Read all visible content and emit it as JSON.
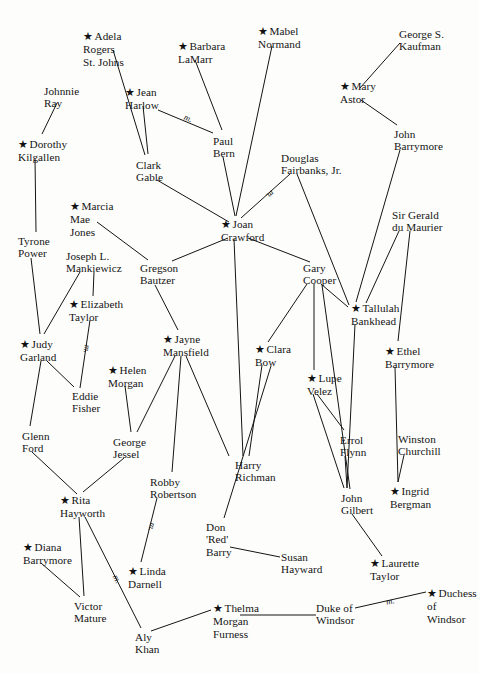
{
  "canvas": {
    "width": 479,
    "height": 674,
    "background": "#fdfdfb",
    "ink": "#141414"
  },
  "legend": {
    "star_glyph": "★",
    "star_meaning": "starred person",
    "marriage_marker": "m.",
    "marriage_meaning": "marriage"
  },
  "nodes": [
    {
      "id": "adela",
      "label": "Adela\nRogers\nSt. Johns",
      "star": true,
      "x": 83,
      "y": 30,
      "align": "left"
    },
    {
      "id": "barbara",
      "label": "Barbara\nLaMarr",
      "star": true,
      "x": 178,
      "y": 40,
      "align": "left"
    },
    {
      "id": "mabel",
      "label": "Mabel\nNormand",
      "star": true,
      "x": 258,
      "y": 25,
      "align": "left"
    },
    {
      "id": "kaufman",
      "label": "George S.\nKaufman",
      "star": false,
      "x": 399,
      "y": 28,
      "align": "left"
    },
    {
      "id": "johnnie",
      "label": "Johnnie\nRay",
      "star": false,
      "x": 44,
      "y": 85,
      "align": "left"
    },
    {
      "id": "harlow",
      "label": "Jean\nHarlow",
      "star": true,
      "x": 125,
      "y": 86,
      "align": "left"
    },
    {
      "id": "maryastor",
      "label": "Mary\nAstor",
      "star": true,
      "x": 340,
      "y": 80,
      "align": "left"
    },
    {
      "id": "dorothy",
      "label": "Dorothy\nKilgallen",
      "star": true,
      "x": 18,
      "y": 138,
      "align": "left"
    },
    {
      "id": "paulbern",
      "label": "Paul\nBern",
      "star": false,
      "x": 213,
      "y": 135,
      "align": "left"
    },
    {
      "id": "jbarry",
      "label": "John\nBarrymore",
      "star": false,
      "x": 394,
      "y": 128,
      "align": "left"
    },
    {
      "id": "gable",
      "label": "Clark\nGable",
      "star": false,
      "x": 136,
      "y": 159,
      "align": "left"
    },
    {
      "id": "fairbanks",
      "label": "Douglas\nFairbanks, Jr.",
      "star": false,
      "x": 281,
      "y": 152,
      "align": "left"
    },
    {
      "id": "marcia",
      "label": "Marcia\nMae\nJones",
      "star": true,
      "x": 70,
      "y": 200,
      "align": "left"
    },
    {
      "id": "joan",
      "label": "Joan\nCrawford",
      "star": true,
      "x": 221,
      "y": 218,
      "align": "left"
    },
    {
      "id": "gerald",
      "label": "Sir Gerald\ndu Maurier",
      "star": false,
      "x": 392,
      "y": 209,
      "align": "left"
    },
    {
      "id": "tyrone",
      "label": "Tyrone\nPower",
      "star": false,
      "x": 18,
      "y": 235,
      "align": "left"
    },
    {
      "id": "joseph",
      "label": "Joseph L.\nMankiewicz",
      "star": false,
      "x": 66,
      "y": 250,
      "align": "left"
    },
    {
      "id": "gregson",
      "label": "Gregson\nBautzer",
      "star": false,
      "x": 140,
      "y": 262,
      "align": "left"
    },
    {
      "id": "gary",
      "label": "Gary\nCooper",
      "star": false,
      "x": 303,
      "y": 262,
      "align": "left"
    },
    {
      "id": "elizabeth",
      "label": "Elizabeth\nTaylor",
      "star": true,
      "x": 69,
      "y": 298,
      "align": "left"
    },
    {
      "id": "tallulah",
      "label": "Tallulah\nBankhead",
      "star": true,
      "x": 351,
      "y": 302,
      "align": "left"
    },
    {
      "id": "jayne",
      "label": "Jayne\nMansfield",
      "star": true,
      "x": 163,
      "y": 333,
      "align": "left"
    },
    {
      "id": "judy",
      "label": "Judy\nGarland",
      "star": true,
      "x": 20,
      "y": 338,
      "align": "left"
    },
    {
      "id": "clara",
      "label": "Clara\nBow",
      "star": true,
      "x": 255,
      "y": 343,
      "align": "left"
    },
    {
      "id": "ethel",
      "label": "Ethel\nBarrymore",
      "star": true,
      "x": 385,
      "y": 345,
      "align": "left"
    },
    {
      "id": "helen",
      "label": "Helen\nMorgan",
      "star": true,
      "x": 108,
      "y": 364,
      "align": "left"
    },
    {
      "id": "lupe",
      "label": "Lupe\nVelez",
      "star": true,
      "x": 307,
      "y": 372,
      "align": "left"
    },
    {
      "id": "eddie",
      "label": "Eddie\nFisher",
      "star": false,
      "x": 72,
      "y": 390,
      "align": "left"
    },
    {
      "id": "glenn",
      "label": "Glenn\nFord",
      "star": false,
      "x": 22,
      "y": 430,
      "align": "left"
    },
    {
      "id": "jessel",
      "label": "George\nJessel",
      "star": false,
      "x": 113,
      "y": 436,
      "align": "left"
    },
    {
      "id": "errol",
      "label": "Errol\nFlynn",
      "star": false,
      "x": 340,
      "y": 434,
      "align": "left"
    },
    {
      "id": "winston",
      "label": "Winston\nChurchill",
      "star": false,
      "x": 398,
      "y": 433,
      "align": "left"
    },
    {
      "id": "robby",
      "label": "Robby\nRobertson",
      "star": false,
      "x": 150,
      "y": 476,
      "align": "left"
    },
    {
      "id": "harryr",
      "label": "Harry\nRichman",
      "star": false,
      "x": 235,
      "y": 459,
      "align": "left"
    },
    {
      "id": "rita",
      "label": "Rita\nHayworth",
      "star": true,
      "x": 60,
      "y": 494,
      "align": "left"
    },
    {
      "id": "gilbert",
      "label": "John\nGilbert",
      "star": false,
      "x": 341,
      "y": 492,
      "align": "left"
    },
    {
      "id": "ingrid",
      "label": "Ingrid\nBergman",
      "star": true,
      "x": 390,
      "y": 485,
      "align": "left"
    },
    {
      "id": "donred",
      "label": "Don\n'Red'\nBarry",
      "star": false,
      "x": 206,
      "y": 521,
      "align": "left"
    },
    {
      "id": "diana",
      "label": "Diana\nBarrymore",
      "star": true,
      "x": 23,
      "y": 541,
      "align": "left"
    },
    {
      "id": "susan",
      "label": "Susan\nHayward",
      "star": false,
      "x": 281,
      "y": 551,
      "align": "left"
    },
    {
      "id": "laurette",
      "label": "Laurette\nTaylor",
      "star": true,
      "x": 370,
      "y": 557,
      "align": "left"
    },
    {
      "id": "linda",
      "label": "Linda\nDarnell",
      "star": true,
      "x": 128,
      "y": 565,
      "align": "left"
    },
    {
      "id": "duchess",
      "label": "Duchess of\nWindsor",
      "star": true,
      "x": 427,
      "y": 587,
      "align": "left"
    },
    {
      "id": "victor",
      "label": "Victor\nMature",
      "x": 74,
      "y": 600,
      "star": false,
      "align": "left"
    },
    {
      "id": "thelma",
      "label": "Thelma\nMorgan\nFurness",
      "star": true,
      "x": 213,
      "y": 602,
      "align": "left"
    },
    {
      "id": "dukew",
      "label": "Duke of\nWindsor",
      "star": false,
      "x": 316,
      "y": 602,
      "align": "left"
    },
    {
      "id": "aly",
      "label": "Aly\nKhan",
      "star": false,
      "x": 135,
      "y": 631,
      "align": "left"
    }
  ],
  "edges": [
    {
      "from": "adela",
      "to": "gable",
      "x1": 113,
      "y1": 50,
      "x2": 145,
      "y2": 155,
      "marriage": false
    },
    {
      "from": "barbara",
      "to": "paulbern",
      "x1": 195,
      "y1": 60,
      "x2": 222,
      "y2": 130,
      "marriage": false
    },
    {
      "from": "mabel",
      "to": "joan",
      "x1": 272,
      "y1": 46,
      "x2": 236,
      "y2": 216,
      "marriage": false
    },
    {
      "from": "kaufman",
      "to": "maryastor",
      "x1": 400,
      "y1": 43,
      "x2": 360,
      "y2": 88,
      "marriage": false
    },
    {
      "from": "johnnie",
      "to": "dorothy",
      "x1": 57,
      "y1": 103,
      "x2": 42,
      "y2": 134,
      "marriage": false
    },
    {
      "from": "harlow",
      "to": "gable",
      "x1": 143,
      "y1": 106,
      "x2": 148,
      "y2": 154,
      "marriage": false
    },
    {
      "from": "harlow",
      "to": "paulbern",
      "x1": 158,
      "y1": 110,
      "x2": 213,
      "y2": 133,
      "marriage": true,
      "mx": 184,
      "my": 113
    },
    {
      "from": "maryastor",
      "to": "jbarry",
      "x1": 361,
      "y1": 100,
      "x2": 397,
      "y2": 125,
      "marriage": false
    },
    {
      "from": "dorothy",
      "to": "tyrone",
      "x1": 35,
      "y1": 158,
      "x2": 36,
      "y2": 232,
      "marriage": false
    },
    {
      "from": "paulbern",
      "to": "joan",
      "x1": 223,
      "y1": 157,
      "x2": 235,
      "y2": 216,
      "marriage": false
    },
    {
      "from": "gable",
      "to": "joan",
      "x1": 157,
      "y1": 180,
      "x2": 229,
      "y2": 222,
      "marriage": false
    },
    {
      "from": "fairbanks",
      "to": "joan",
      "x1": 290,
      "y1": 174,
      "x2": 241,
      "y2": 218,
      "marriage": true,
      "mx": 266,
      "my": 190
    },
    {
      "from": "fairbanks",
      "to": "tallulah",
      "x1": 297,
      "y1": 174,
      "x2": 349,
      "y2": 305,
      "marriage": false
    },
    {
      "from": "jbarry",
      "to": "tallulah",
      "x1": 400,
      "y1": 150,
      "x2": 356,
      "y2": 302,
      "marriage": false
    },
    {
      "from": "marcia",
      "to": "gregson",
      "x1": 97,
      "y1": 222,
      "x2": 148,
      "y2": 260,
      "marriage": false
    },
    {
      "from": "joan",
      "to": "gregson",
      "x1": 228,
      "y1": 238,
      "x2": 172,
      "y2": 261,
      "marriage": false
    },
    {
      "from": "joan",
      "to": "gary",
      "x1": 248,
      "y1": 238,
      "x2": 310,
      "y2": 262,
      "marriage": false
    },
    {
      "from": "joan",
      "to": "harryr",
      "x1": 234,
      "y1": 239,
      "x2": 243,
      "y2": 456,
      "marriage": false
    },
    {
      "from": "gerald",
      "to": "tallulah",
      "x1": 399,
      "y1": 231,
      "x2": 366,
      "y2": 303,
      "marriage": false
    },
    {
      "from": "gerald",
      "to": "ethel",
      "x1": 410,
      "y1": 231,
      "x2": 398,
      "y2": 341,
      "marriage": false
    },
    {
      "from": "tyrone",
      "to": "judy",
      "x1": 31,
      "y1": 258,
      "x2": 40,
      "y2": 334,
      "marriage": false
    },
    {
      "from": "joseph",
      "to": "judy",
      "x1": 80,
      "y1": 272,
      "x2": 44,
      "y2": 334,
      "marriage": false
    },
    {
      "from": "joseph",
      "to": "elizabeth",
      "x1": 94,
      "y1": 272,
      "x2": 93,
      "y2": 296,
      "marriage": false
    },
    {
      "from": "gregson",
      "to": "jayne",
      "x1": 155,
      "y1": 285,
      "x2": 178,
      "y2": 330,
      "marriage": false
    },
    {
      "from": "gary",
      "to": "tallulah",
      "x1": 321,
      "y1": 284,
      "x2": 348,
      "y2": 307,
      "marriage": false
    },
    {
      "from": "gary",
      "to": "clara",
      "x1": 307,
      "y1": 284,
      "x2": 268,
      "y2": 342,
      "marriage": false
    },
    {
      "from": "gary",
      "to": "lupe",
      "x1": 314,
      "y1": 284,
      "x2": 314,
      "y2": 370,
      "marriage": false
    },
    {
      "from": "gary",
      "to": "gilbert",
      "x1": 322,
      "y1": 285,
      "x2": 350,
      "y2": 489,
      "marriage": false
    },
    {
      "from": "elizabeth",
      "to": "eddie",
      "x1": 90,
      "y1": 320,
      "x2": 80,
      "y2": 388,
      "marriage": true,
      "mx": 83,
      "my": 344
    },
    {
      "from": "tallulah",
      "to": "gilbert",
      "x1": 355,
      "y1": 324,
      "x2": 347,
      "y2": 488,
      "marriage": false
    },
    {
      "from": "jayne",
      "to": "jessel",
      "x1": 175,
      "y1": 356,
      "x2": 137,
      "y2": 432,
      "marriage": false
    },
    {
      "from": "jayne",
      "to": "robby",
      "x1": 181,
      "y1": 356,
      "x2": 172,
      "y2": 472,
      "marriage": false
    },
    {
      "from": "jayne",
      "to": "harryr",
      "x1": 186,
      "y1": 356,
      "x2": 229,
      "y2": 456,
      "marriage": false
    },
    {
      "from": "judy",
      "to": "eddie",
      "x1": 47,
      "y1": 361,
      "x2": 74,
      "y2": 387,
      "marriage": false
    },
    {
      "from": "judy",
      "to": "glenn",
      "x1": 41,
      "y1": 361,
      "x2": 30,
      "y2": 426,
      "marriage": false
    },
    {
      "from": "clara",
      "to": "harryr",
      "x1": 262,
      "y1": 365,
      "x2": 249,
      "y2": 456,
      "marriage": false
    },
    {
      "from": "clara",
      "to": "donred",
      "x1": 271,
      "y1": 366,
      "x2": 224,
      "y2": 518,
      "marriage": false
    },
    {
      "from": "ethel",
      "to": "ingrid",
      "x1": 395,
      "y1": 367,
      "x2": 398,
      "y2": 482,
      "marriage": false
    },
    {
      "from": "helen",
      "to": "jessel",
      "x1": 125,
      "y1": 386,
      "x2": 131,
      "y2": 432,
      "marriage": false
    },
    {
      "from": "lupe",
      "to": "errol",
      "x1": 317,
      "y1": 394,
      "x2": 344,
      "y2": 430,
      "marriage": false
    },
    {
      "from": "lupe",
      "to": "gilbert",
      "x1": 313,
      "y1": 394,
      "x2": 344,
      "y2": 488,
      "marriage": false
    },
    {
      "from": "errol",
      "to": "gilbert",
      "x1": 345,
      "y1": 456,
      "x2": 347,
      "y2": 488,
      "marriage": false
    },
    {
      "from": "winston",
      "to": "ingrid",
      "x1": 404,
      "y1": 455,
      "x2": 398,
      "y2": 482,
      "marriage": false
    },
    {
      "from": "jessel",
      "to": "rita",
      "x1": 124,
      "y1": 458,
      "x2": 83,
      "y2": 492,
      "marriage": false
    },
    {
      "from": "robby",
      "to": "linda",
      "x1": 157,
      "y1": 498,
      "x2": 141,
      "y2": 562,
      "marriage": true,
      "mx": 148,
      "my": 522
    },
    {
      "from": "glenn",
      "to": "rita",
      "x1": 32,
      "y1": 452,
      "x2": 77,
      "y2": 494,
      "marriage": false
    },
    {
      "from": "gilbert",
      "to": "laurette",
      "x1": 352,
      "y1": 514,
      "x2": 382,
      "y2": 556,
      "marriage": false
    },
    {
      "from": "rita",
      "to": "victor",
      "x1": 79,
      "y1": 517,
      "x2": 84,
      "y2": 596,
      "marriage": false
    },
    {
      "from": "rita",
      "to": "aly",
      "x1": 85,
      "y1": 517,
      "x2": 141,
      "y2": 628,
      "marriage": true,
      "mx": 113,
      "my": 574
    },
    {
      "from": "donred",
      "to": "susan",
      "x1": 230,
      "y1": 547,
      "x2": 280,
      "y2": 557,
      "marriage": false
    },
    {
      "from": "diana",
      "to": "victor",
      "x1": 41,
      "y1": 563,
      "x2": 80,
      "y2": 597,
      "marriage": false
    },
    {
      "from": "dukew",
      "to": "duchess",
      "x1": 355,
      "y1": 608,
      "x2": 426,
      "y2": 592,
      "marriage": true,
      "mx": 386,
      "my": 596
    },
    {
      "from": "thelma",
      "to": "dukew",
      "x1": 240,
      "y1": 615,
      "x2": 316,
      "y2": 615,
      "marriage": false
    },
    {
      "from": "aly",
      "to": "thelma",
      "x1": 151,
      "y1": 631,
      "x2": 211,
      "y2": 610,
      "marriage": false
    }
  ]
}
